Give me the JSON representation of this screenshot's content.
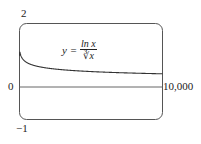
{
  "chart_data": {
    "type": "line",
    "title": "",
    "formula": "y = ln x / ∛x",
    "formula_parts": {
      "lhs": "y =",
      "numerator": "ln x",
      "denominator": "∛x"
    },
    "xlabel": "",
    "ylabel": "",
    "xlim": [
      0,
      10000
    ],
    "ylim": [
      -1,
      2
    ],
    "tick_labels": {
      "y_top": "2",
      "y_zero": "0",
      "y_bottom": "−1",
      "x_right": "10,000"
    },
    "grid": false,
    "series": [
      {
        "name": "y = ln x / ∛x",
        "x": [
          1,
          20,
          100,
          500,
          1000,
          2000,
          4000,
          6000,
          8000,
          10000
        ],
        "values": [
          0,
          1.1,
          0.99,
          0.78,
          0.69,
          0.6,
          0.52,
          0.48,
          0.45,
          0.43
        ]
      }
    ]
  }
}
